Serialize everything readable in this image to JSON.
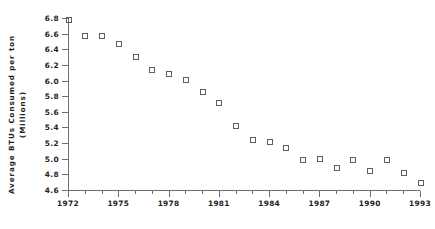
{
  "chart_data": {
    "type": "scatter",
    "title": "",
    "subtitle": "",
    "xlabel": "",
    "ylabel": "Average BTUs Consumed per ton (Millions)",
    "ylabel_lines": [
      "Average BTUs Consumed per ton",
      "(Millions)"
    ],
    "x": [
      1972,
      1973,
      1974,
      1975,
      1976,
      1977,
      1978,
      1979,
      1980,
      1981,
      1982,
      1983,
      1984,
      1985,
      1986,
      1987,
      1988,
      1989,
      1990,
      1991,
      1992,
      1993
    ],
    "values": [
      6.78,
      6.57,
      6.57,
      6.48,
      6.31,
      6.14,
      6.09,
      6.01,
      5.86,
      5.72,
      5.43,
      5.25,
      5.22,
      5.15,
      4.99,
      5.0,
      4.89,
      4.99,
      4.85,
      4.99,
      4.82,
      4.7
    ],
    "xlim": [
      1972,
      1993
    ],
    "ylim": [
      4.6,
      6.8
    ],
    "yticks": [
      4.6,
      4.8,
      5.0,
      5.2,
      5.4,
      5.6,
      5.8,
      6.0,
      6.2,
      6.4,
      6.6,
      6.8
    ],
    "ytick_labels": [
      "4.6",
      "4.8",
      "5.0",
      "5.2",
      "5.4",
      "5.6",
      "5.8",
      "6.0",
      "6.2",
      "6.4",
      "6.6",
      "6.8"
    ],
    "xticks_major": [
      1972,
      1975,
      1978,
      1981,
      1984,
      1987,
      1990,
      1993
    ],
    "xtick_labels": [
      "1972",
      "1975",
      "1978",
      "1981",
      "1984",
      "1987",
      "1990",
      "1993"
    ],
    "xticks_minor": [
      1973,
      1974,
      1976,
      1977,
      1979,
      1980,
      1982,
      1983,
      1985,
      1986,
      1988,
      1989,
      1991,
      1992
    ],
    "grid": false,
    "legend": null,
    "marker_style": "open-square",
    "marker_color": "#5d5d66",
    "axis_color": "#6e6e6e"
  }
}
